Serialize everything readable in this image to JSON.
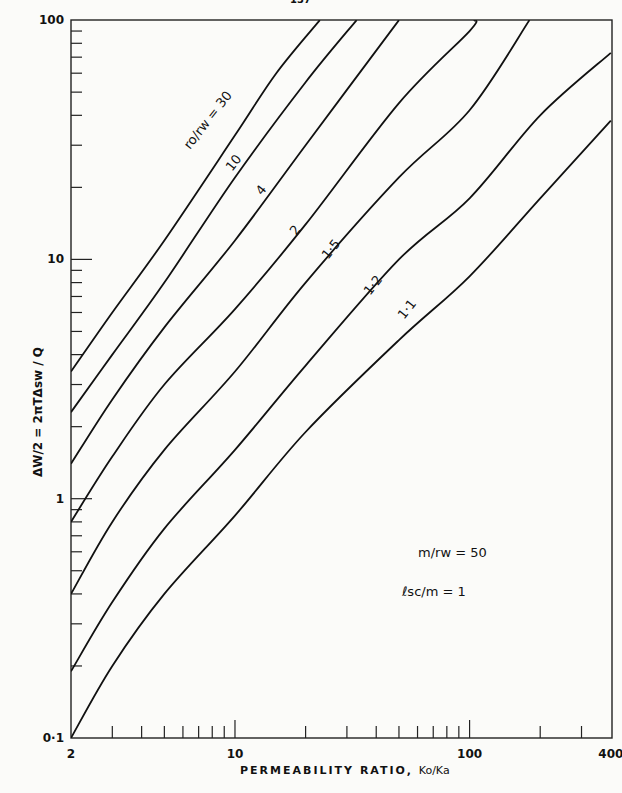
{
  "page": {
    "number_fragment": "137"
  },
  "chart_data": {
    "type": "line",
    "title": "",
    "xlabel": "PERMEABILITY RATIO, Ko/Ka",
    "ylabel": "ΔW/2 = 2πTΔsw / Q",
    "xscale": "log",
    "yscale": "log",
    "xlim": [
      2,
      400
    ],
    "ylim": [
      0.1,
      100
    ],
    "x_tick_labels": [
      "2",
      "10",
      "100",
      "400"
    ],
    "y_tick_labels": [
      "0·1",
      "1",
      "10",
      "100"
    ],
    "grid": false,
    "legend_position": "inline curve labels",
    "series_parameter": "ro/rw",
    "series": [
      {
        "name": "ro/rw = 30",
        "label": "ro/rw = 30",
        "points": [
          [
            2,
            3.4
          ],
          [
            3,
            6
          ],
          [
            5,
            12
          ],
          [
            10,
            33
          ],
          [
            15,
            60
          ],
          [
            23,
            100
          ]
        ]
      },
      {
        "name": "10",
        "label": "10",
        "points": [
          [
            2,
            2.3
          ],
          [
            3,
            4
          ],
          [
            5,
            8
          ],
          [
            10,
            22
          ],
          [
            20,
            55
          ],
          [
            33,
            100
          ]
        ]
      },
      {
        "name": "4",
        "label": "4",
        "points": [
          [
            2,
            1.4
          ],
          [
            3,
            2.6
          ],
          [
            5,
            5.2
          ],
          [
            10,
            12
          ],
          [
            20,
            30
          ],
          [
            50,
            100
          ]
        ]
      },
      {
        "name": "2",
        "label": "2",
        "points": [
          [
            2,
            0.8
          ],
          [
            3,
            1.5
          ],
          [
            5,
            3
          ],
          [
            10,
            6.2
          ],
          [
            20,
            14
          ],
          [
            50,
            45
          ],
          [
            100,
            90
          ],
          [
            105,
            100
          ]
        ]
      },
      {
        "name": "1·5",
        "label": "1·5",
        "points": [
          [
            2,
            0.4
          ],
          [
            3,
            0.8
          ],
          [
            5,
            1.6
          ],
          [
            10,
            3.4
          ],
          [
            20,
            8
          ],
          [
            50,
            22
          ],
          [
            100,
            42
          ],
          [
            180,
            100
          ]
        ]
      },
      {
        "name": "1·2",
        "label": "1·2",
        "points": [
          [
            2,
            0.19
          ],
          [
            3,
            0.37
          ],
          [
            5,
            0.75
          ],
          [
            10,
            1.6
          ],
          [
            20,
            3.6
          ],
          [
            50,
            10
          ],
          [
            100,
            18
          ],
          [
            200,
            40
          ],
          [
            400,
            73
          ]
        ]
      },
      {
        "name": "1·1",
        "label": "1·1",
        "points": [
          [
            2,
            0.1
          ],
          [
            3,
            0.2
          ],
          [
            5,
            0.4
          ],
          [
            10,
            0.85
          ],
          [
            20,
            1.9
          ],
          [
            50,
            4.6
          ],
          [
            100,
            8.5
          ],
          [
            200,
            18
          ],
          [
            400,
            38
          ]
        ]
      }
    ],
    "annotations": [
      "m/rw = 50",
      "lsc/m = 1"
    ]
  },
  "labels": {
    "xlabel_main": "PERMEABILITY RATIO,",
    "xlabel_ratio": "Ko/Ka",
    "ylabel": "ΔW/2  =  2πTΔsw / Q",
    "param1": "m/rw = 50",
    "param2": "ℓsc/m = 1"
  },
  "curve_label_positions": [
    {
      "text": "ro/rw = 30",
      "x": 190,
      "y": 150,
      "rot": -52
    },
    {
      "text": "10",
      "x": 232,
      "y": 172,
      "rot": -52
    },
    {
      "text": "4",
      "x": 262,
      "y": 196,
      "rot": -52
    },
    {
      "text": "2",
      "x": 296,
      "y": 236,
      "rot": -52
    },
    {
      "text": "1·5",
      "x": 328,
      "y": 260,
      "rot": -52
    },
    {
      "text": "1·2",
      "x": 370,
      "y": 296,
      "rot": -52
    },
    {
      "text": "1·1",
      "x": 404,
      "y": 320,
      "rot": -52
    }
  ]
}
